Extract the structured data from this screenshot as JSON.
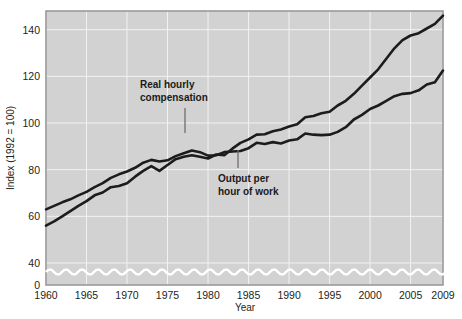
{
  "chart_data": {
    "type": "line",
    "title": "",
    "xlabel": "Year",
    "ylabel": "Index (1992 = 100)",
    "xlim": [
      1960,
      2009
    ],
    "ylim": [
      0,
      148
    ],
    "grid": true,
    "legend_position": "inline-annotations",
    "axis_break": "y-axis broken between 0 and 40",
    "xticks": [
      "1960",
      "1965",
      "1970",
      "1975",
      "1980",
      "1985",
      "1990",
      "1995",
      "2000",
      "2005",
      "2009"
    ],
    "xtick_values": [
      1960,
      1965,
      1970,
      1975,
      1980,
      1985,
      1990,
      1995,
      2000,
      2005,
      2009
    ],
    "yticks": [
      "0",
      "40",
      "60",
      "80",
      "100",
      "120",
      "140"
    ],
    "ytick_values": [
      0,
      40,
      60,
      80,
      100,
      120,
      140
    ],
    "x": [
      1960,
      1961,
      1962,
      1963,
      1964,
      1965,
      1966,
      1967,
      1968,
      1969,
      1970,
      1971,
      1972,
      1973,
      1974,
      1975,
      1976,
      1977,
      1978,
      1979,
      1980,
      1981,
      1982,
      1983,
      1984,
      1985,
      1986,
      1987,
      1988,
      1989,
      1990,
      1991,
      1992,
      1993,
      1994,
      1995,
      1996,
      1997,
      1998,
      1999,
      2000,
      2001,
      2002,
      2003,
      2004,
      2005,
      2006,
      2007,
      2008,
      2009
    ],
    "series": [
      {
        "name": "Real hourly compensation",
        "values": [
          63.0,
          64.5,
          66.0,
          67.3,
          69.0,
          70.5,
          72.5,
          74.2,
          76.5,
          78.0,
          79.2,
          80.8,
          83.0,
          84.2,
          83.5,
          84.0,
          85.8,
          87.0,
          88.2,
          87.5,
          86.0,
          86.2,
          87.5,
          87.8,
          88.0,
          89.2,
          91.5,
          91.0,
          91.8,
          91.2,
          92.5,
          93.0,
          95.5,
          95.0,
          94.8,
          95.0,
          96.2,
          98.2,
          101.5,
          103.5,
          106.0,
          107.5,
          109.5,
          111.5,
          112.5,
          112.8,
          114.0,
          116.5,
          117.5,
          122.5
        ],
        "color": "#1c1c1c",
        "annotation": "Real hourly compensation"
      },
      {
        "name": "Output per hour of work",
        "values": [
          56.0,
          57.8,
          60.0,
          62.2,
          64.5,
          66.5,
          69.0,
          70.2,
          72.5,
          73.0,
          74.2,
          77.0,
          79.5,
          81.5,
          79.5,
          82.0,
          84.5,
          85.5,
          86.2,
          85.5,
          84.8,
          86.5,
          86.2,
          89.0,
          91.5,
          93.0,
          95.0,
          95.2,
          96.5,
          97.2,
          98.5,
          99.5,
          102.5,
          103.0,
          104.2,
          104.8,
          107.5,
          109.5,
          112.5,
          116.0,
          119.5,
          123.0,
          127.5,
          132.0,
          135.5,
          137.5,
          138.5,
          140.5,
          142.5,
          146.0
        ],
        "color": "#1c1c1c",
        "annotation": "Output per hour of work"
      }
    ],
    "annotations": [
      {
        "text_line1": "Real hourly",
        "text_line2": "compensation",
        "target_series": "Real hourly compensation"
      },
      {
        "text_line1": "Output per",
        "text_line2": "hour of work",
        "target_series": "Output per hour of work"
      }
    ]
  },
  "colors": {
    "plot_background": "#d2d2d2",
    "page_background": "#ffffff",
    "gridline": "#f2f2f2",
    "line": "#1c1c1c",
    "frame": "#9a9a9a",
    "text": "#231f20"
  }
}
